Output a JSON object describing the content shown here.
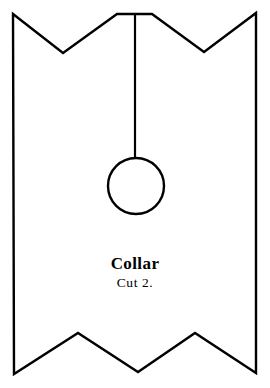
{
  "document": {
    "title": "Collar",
    "kind": "sewing-pattern-piece",
    "background_color": "#ffffff",
    "ink_color": "#000000"
  },
  "labels": {
    "piece_name": "Collar",
    "cut_instruction": "Cut 2."
  },
  "drawing": {
    "stroke_color": "#000000",
    "fill_color": "#ffffff",
    "stroke_width": 2.4,
    "outline_path": "M 13 14 L 63 53 L 117 14 L 152 14 L 204 52 L 256 13 L 256 373 L 195 333 L 138 372 L 78 333 L 14 374 Z",
    "fold_line": {
      "x1": 135,
      "y1": 14,
      "x2": 135,
      "y2": 158,
      "stroke_width": 2.2
    },
    "button_circle": {
      "cx": 136,
      "cy": 186,
      "r": 28,
      "stroke_width": 2.4
    }
  },
  "geometry_notes": {
    "top_notches": 2,
    "bottom_points": 2,
    "canvas_width": 270,
    "canvas_height": 388
  }
}
